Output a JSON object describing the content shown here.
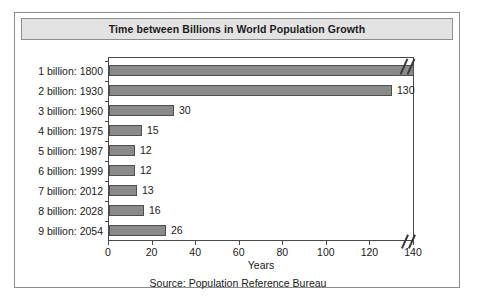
{
  "figure": {
    "title": "Time between Billions in World Population Growth",
    "source": "Source: Population Reference Bureau"
  },
  "chart_data": {
    "type": "bar",
    "orientation": "horizontal",
    "title": "Time between Billions in World Population Growth",
    "xlabel": "Years",
    "ylabel": "",
    "xlim": [
      0,
      140
    ],
    "xticks": [
      0,
      20,
      40,
      60,
      80,
      100,
      120,
      140
    ],
    "grid": false,
    "legend": false,
    "axis_break": true,
    "axis_break_note": "x-axis is broken after 140; the first bar extends beyond the plotted range",
    "bar_color": "#8a8a8a",
    "bar_edge_color": "#4f4f4f",
    "categories": [
      "1 billion: 1800",
      "2 billion: 1930",
      "3 billion: 1960",
      "4 billion: 1975",
      "5 billion: 1987",
      "6 billion: 1999",
      "7 billion: 2012",
      "8 billion: 2028",
      "9 billion: 2054"
    ],
    "values": [
      null,
      130,
      30,
      15,
      12,
      12,
      13,
      16,
      26
    ],
    "value_labels": [
      "",
      "130",
      "30",
      "15",
      "12",
      "12",
      "13",
      "16",
      "26"
    ],
    "bars": [
      {
        "category": "1 billion: 1800",
        "milestone": 1,
        "year": 1800,
        "value": null,
        "label": "",
        "truncated": true
      },
      {
        "category": "2 billion: 1930",
        "milestone": 2,
        "year": 1930,
        "value": 130,
        "label": "130",
        "truncated": false
      },
      {
        "category": "3 billion: 1960",
        "milestone": 3,
        "year": 1960,
        "value": 30,
        "label": "30",
        "truncated": false
      },
      {
        "category": "4 billion: 1975",
        "milestone": 4,
        "year": 1975,
        "value": 15,
        "label": "15",
        "truncated": false
      },
      {
        "category": "5 billion: 1987",
        "milestone": 5,
        "year": 1987,
        "value": 12,
        "label": "12",
        "truncated": false
      },
      {
        "category": "6 billion: 1999",
        "milestone": 6,
        "year": 1999,
        "value": 12,
        "label": "12",
        "truncated": false
      },
      {
        "category": "7 billion: 2012",
        "milestone": 7,
        "year": 2012,
        "value": 13,
        "label": "13",
        "truncated": false
      },
      {
        "category": "8 billion: 2028",
        "milestone": 8,
        "year": 2028,
        "value": 16,
        "label": "16",
        "truncated": false
      },
      {
        "category": "9 billion: 2054",
        "milestone": 9,
        "year": 2054,
        "value": 26,
        "label": "26",
        "truncated": false
      }
    ]
  }
}
